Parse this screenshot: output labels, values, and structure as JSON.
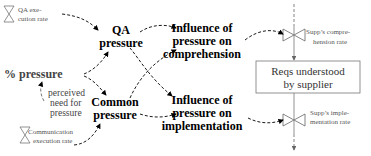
{
  "nodes": {
    "qa_exec_rate": {
      "line1": "QA exe-",
      "line2": "cution rate"
    },
    "qa_pressure": {
      "line1": "QA",
      "line2": "pressure"
    },
    "pct_pressure": {
      "label": "% pressure"
    },
    "perceived_need": {
      "line1": "perceived",
      "line2": "need for",
      "line3": "pressure"
    },
    "comm_exec_rate": {
      "line1": "Communication",
      "line2": "execution rate"
    },
    "common_pressure": {
      "line1": "Common",
      "line2": "pressure"
    },
    "infl_comprehension": {
      "line1": "Influence of",
      "line2": "pressure on",
      "line3": "comprehension"
    },
    "infl_implementation": {
      "line1": "Influence of",
      "line2": "pressure on",
      "line3": "implementation"
    },
    "reqs_stock": {
      "line1": "Reqs understood",
      "line2": "by supplier"
    },
    "comp_rate": {
      "line1": "Supp’s compre-",
      "line2": "hension rate"
    },
    "impl_rate": {
      "line1": "Supp’s imple-",
      "line2": "mentation rate"
    }
  },
  "colors": {
    "primary": "#000000",
    "secondary": "#666666"
  }
}
